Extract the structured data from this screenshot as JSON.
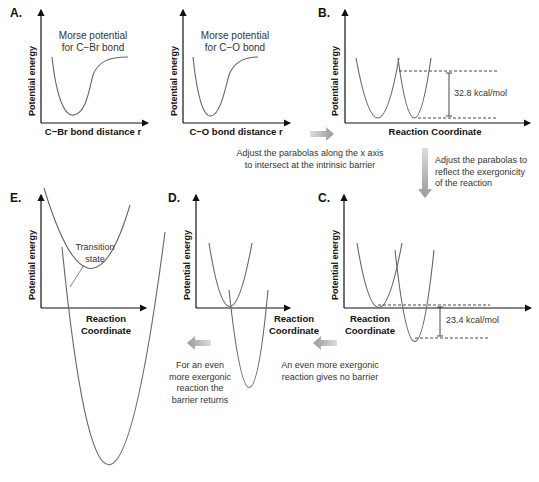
{
  "panels": {
    "A": {
      "label": "A.",
      "left": {
        "curve_label_1": "Morse potential",
        "curve_label_2": "for C−Br bond",
        "ylabel": "Potential energy",
        "xlabel": "C−Br bond distance r"
      },
      "right": {
        "curve_label_1": "Morse potential",
        "curve_label_2": "for C−O bond",
        "ylabel": "Potential energy",
        "xlabel": "C−O bond distance r"
      }
    },
    "B": {
      "label": "B.",
      "ylabel": "Potential energy",
      "xlabel": "Reaction Coordinate",
      "barrier": "32.8 kcal/mol"
    },
    "C": {
      "label": "C.",
      "ylabel": "Potential energy",
      "xlabel_1": "Reaction",
      "xlabel_2": "Coordinate",
      "gap": "23.4 kcal/mol"
    },
    "D": {
      "label": "D.",
      "ylabel": "Potential energy",
      "xlabel_1": "Reaction",
      "xlabel_2": "Coordinate"
    },
    "E": {
      "label": "E.",
      "ylabel": "Potential energy",
      "xlabel_1": "Reaction",
      "xlabel_2": "Coordinate",
      "annotation_1": "Transition",
      "annotation_2": "state"
    }
  },
  "notes": {
    "a_to_b_1": "Adjust the parabolas along the x axis",
    "a_to_b_2": "to intersect at the intrinsic barrier",
    "b_to_c_1": "Adjust the parabolas to",
    "b_to_c_2": "reflect the exergonicity",
    "b_to_c_3": "of the reaction",
    "c_to_d_1": "An even more exergonic",
    "c_to_d_2": "reaction gives no barrier",
    "d_to_e_1": "For an even",
    "d_to_e_2": "more exergonic",
    "d_to_e_3": "reaction the",
    "d_to_e_4": "barrier returns"
  },
  "colors": {
    "axis": "#111111",
    "curve": "#666666",
    "arrow": "#9a9a9a"
  }
}
